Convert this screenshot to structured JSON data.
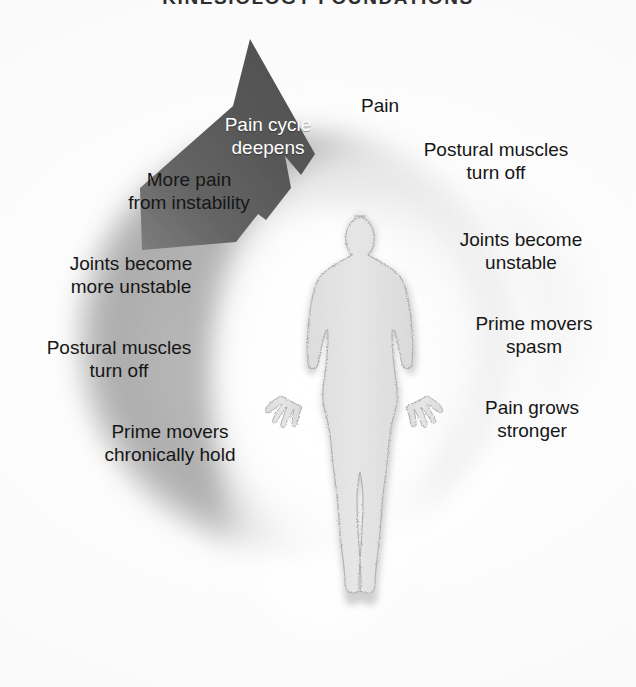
{
  "title": "KINESIOLOGY FOUNDATIONS",
  "arrow": {
    "label": "Pain cycle\ndeepens",
    "name": "pain-cycle-deepens-arrow",
    "color": "#585858",
    "text_color": "#ffffff",
    "direction": "clockwise-up-right"
  },
  "figure": {
    "name": "human-body-silhouette",
    "fill": "#e2e2e2",
    "outline": "#b5b5b5"
  },
  "glow": {
    "name": "pain-glow-crescent",
    "color": "#8a8a8a"
  },
  "cycle": {
    "right_column": [
      {
        "id": "pain",
        "text": "Pain"
      },
      {
        "id": "postural-muscles-turn-off-right",
        "text": "Postural muscles\nturn off"
      },
      {
        "id": "joints-become-unstable-right",
        "text": "Joints become\nunstable"
      },
      {
        "id": "prime-movers-spasm",
        "text": "Prime movers\nspasm"
      },
      {
        "id": "pain-grows-stronger",
        "text": "Pain grows\nstronger"
      }
    ],
    "left_column": [
      {
        "id": "more-pain-from-instability",
        "text": "More pain\nfrom instability"
      },
      {
        "id": "joints-become-more-unstable",
        "text": "Joints become\nmore unstable"
      },
      {
        "id": "postural-muscles-turn-off-left",
        "text": "Postural muscles\nturn off"
      },
      {
        "id": "prime-movers-chronically-hold",
        "text": "Prime movers\nchronically hold"
      }
    ]
  },
  "colors": {
    "background": "#ffffff",
    "text": "#161616",
    "arrow_dark": "#585858",
    "glow_gray": "#8a8a8a",
    "body_gray": "#e2e2e2"
  }
}
